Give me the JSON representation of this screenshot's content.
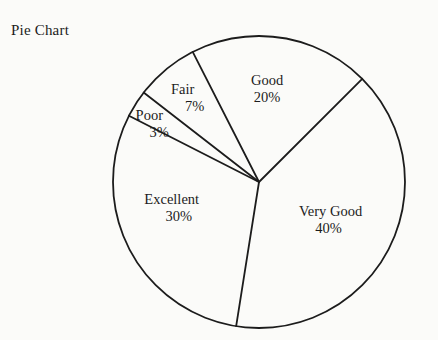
{
  "title": "Pie Chart",
  "colors": {
    "line": "#1c1c1c",
    "text": "#1c1c1c",
    "background": "#fbfbf9"
  },
  "chart_data": {
    "type": "pie",
    "title": "Pie Chart",
    "unit": "percent",
    "categories": [
      "Good",
      "Very Good",
      "Excellent",
      "Poor",
      "Fair"
    ],
    "values": [
      20,
      40,
      30,
      3,
      7
    ],
    "slices": [
      {
        "label": "Good",
        "value": 20,
        "pct_label": "20%",
        "label_angle_deg": 85,
        "label_r": 0.64,
        "pct_dx": 0
      },
      {
        "label": "Very Good",
        "value": 40,
        "pct_label": "40%",
        "label_angle_deg": -28.5,
        "label_r": 0.55,
        "pct_dx": -2
      },
      {
        "label": "Excellent",
        "value": 30,
        "pct_label": "30%",
        "label_angle_deg": 197,
        "label_r": 0.6,
        "pct_dx": 7
      },
      {
        "label": "Poor",
        "value": 3,
        "pct_label": "3%",
        "label_angle_deg": 151,
        "label_r": 0.82,
        "pct_dx": 10
      },
      {
        "label": "Fair",
        "value": 7,
        "pct_label": "7%",
        "label_angle_deg": 130,
        "label_r": 0.75,
        "pct_dx": 12
      }
    ],
    "layout": {
      "cx": 259,
      "cy": 182,
      "r": 146,
      "start_angle_deg": 117,
      "direction": "clockwise",
      "slice_fill": "none",
      "stroke_width": 1.8,
      "legend": "none",
      "label_font_size": 14.5
    }
  }
}
